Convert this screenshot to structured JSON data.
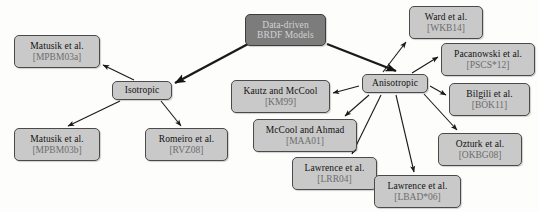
{
  "diagram": {
    "colors": {
      "node_fill": "#c9c9c9",
      "node_border": "#4a4a4a",
      "root_fill": "#7c7c7c",
      "root_text": "#d2d2d2",
      "citation_text": "#6d6d6d",
      "edge": "#1a1a1a",
      "background": "#fdfdfc"
    },
    "nodes": [
      {
        "id": "root",
        "name": "Data-driven",
        "name2": "BRDF Models",
        "cite": "",
        "x": 245,
        "y": 14,
        "w": 81,
        "h": 32,
        "kind": "root"
      },
      {
        "id": "isotropic",
        "name": "Isotropic",
        "cite": "",
        "x": 112,
        "y": 81,
        "w": 60,
        "h": 19,
        "kind": "hub"
      },
      {
        "id": "anisotropic",
        "name": "Anisotropic",
        "cite": "",
        "x": 362,
        "y": 74,
        "w": 66,
        "h": 19,
        "kind": "hub"
      },
      {
        "id": "matusik-a",
        "name": "Matusik et al.",
        "cite": "[MPBM03a]",
        "x": 14,
        "y": 35,
        "w": 86,
        "h": 33,
        "kind": "leaf"
      },
      {
        "id": "matusik-b",
        "name": "Matusik et al.",
        "cite": "[MPBM03b]",
        "x": 14,
        "y": 128,
        "w": 86,
        "h": 33,
        "kind": "leaf"
      },
      {
        "id": "romeiro",
        "name": "Romeiro et al.",
        "cite": "[RVZ08]",
        "x": 145,
        "y": 128,
        "w": 83,
        "h": 33,
        "kind": "leaf"
      },
      {
        "id": "kautz",
        "name": "Kautz and McCool",
        "cite": "[KM99]",
        "x": 231,
        "y": 80,
        "w": 99,
        "h": 33,
        "kind": "leaf"
      },
      {
        "id": "mccool",
        "name": "McCool and Ahmad",
        "cite": "[MAA01]",
        "x": 253,
        "y": 119,
        "w": 104,
        "h": 33,
        "kind": "leaf"
      },
      {
        "id": "lawrence-lrr04",
        "name": "Lawrence et al.",
        "cite": "[LRR04]",
        "x": 292,
        "y": 157,
        "w": 85,
        "h": 33,
        "kind": "leaf"
      },
      {
        "id": "lawrence-lbad06",
        "name": "Lawrence et al.",
        "cite": "[LBAD*06]",
        "x": 374,
        "y": 175,
        "w": 87,
        "h": 33,
        "kind": "leaf"
      },
      {
        "id": "ward",
        "name": "Ward et al.",
        "cite": "[WKB14]",
        "x": 409,
        "y": 6,
        "w": 74,
        "h": 33,
        "kind": "leaf"
      },
      {
        "id": "pacanowski",
        "name": "Pacanowski et al.",
        "cite": "[PSCS*12]",
        "x": 441,
        "y": 43,
        "w": 94,
        "h": 33,
        "kind": "leaf"
      },
      {
        "id": "bilgili",
        "name": "Bilgili et al.",
        "cite": "[BÖK11]",
        "x": 449,
        "y": 83,
        "w": 81,
        "h": 33,
        "kind": "leaf"
      },
      {
        "id": "ozturk",
        "name": "Ozturk et al.",
        "cite": "[OKBG08]",
        "x": 438,
        "y": 133,
        "w": 84,
        "h": 33,
        "kind": "leaf"
      }
    ],
    "edges": [
      {
        "from": "root",
        "to": "isotropic",
        "x1": 248,
        "y1": 44,
        "x2": 175,
        "y2": 83,
        "thick": true
      },
      {
        "from": "root",
        "to": "anisotropic",
        "x1": 327,
        "y1": 44,
        "x2": 396,
        "y2": 71,
        "thick": true
      },
      {
        "from": "isotropic",
        "to": "matusik-a",
        "x1": 134,
        "y1": 80,
        "x2": 103,
        "y2": 65,
        "thick": false
      },
      {
        "from": "isotropic",
        "to": "matusik-b",
        "x1": 120,
        "y1": 101,
        "x2": 68,
        "y2": 126,
        "thick": false
      },
      {
        "from": "isotropic",
        "to": "romeiro",
        "x1": 161,
        "y1": 101,
        "x2": 181,
        "y2": 126,
        "thick": false
      },
      {
        "from": "anisotropic",
        "to": "kautz",
        "x1": 359,
        "y1": 86,
        "x2": 333,
        "y2": 93,
        "thick": false
      },
      {
        "from": "anisotropic",
        "to": "mccool",
        "x1": 369,
        "y1": 95,
        "x2": 345,
        "y2": 116,
        "thick": false
      },
      {
        "from": "anisotropic",
        "to": "lawrence-lrr04",
        "x1": 381,
        "y1": 95,
        "x2": 352,
        "y2": 154,
        "thick": false
      },
      {
        "from": "anisotropic",
        "to": "lawrence-lbad06",
        "x1": 396,
        "y1": 95,
        "x2": 414,
        "y2": 172,
        "thick": false
      },
      {
        "from": "anisotropic",
        "to": "ward",
        "x1": 383,
        "y1": 72,
        "x2": 406,
        "y2": 42,
        "thick": false
      },
      {
        "from": "anisotropic",
        "to": "pacanowski",
        "x1": 412,
        "y1": 73,
        "x2": 438,
        "y2": 57,
        "thick": false
      },
      {
        "from": "anisotropic",
        "to": "bilgili",
        "x1": 430,
        "y1": 86,
        "x2": 446,
        "y2": 95,
        "thick": false
      },
      {
        "from": "anisotropic",
        "to": "ozturk",
        "x1": 424,
        "y1": 94,
        "x2": 457,
        "y2": 130,
        "thick": false
      }
    ]
  }
}
